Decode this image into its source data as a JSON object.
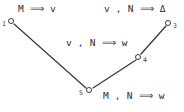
{
  "diagram": {
    "background_color": "#ffffff",
    "stroke_color": "#3a3a3a",
    "text_color": "#2b2b2b",
    "nodes": [
      {
        "id": "1",
        "label": "1",
        "x": 11,
        "y": 21
      },
      {
        "id": "3",
        "label": "3",
        "x": 168,
        "y": 23
      },
      {
        "id": "4",
        "label": "4",
        "x": 138,
        "y": 57
      },
      {
        "id": "5",
        "label": "5",
        "x": 89,
        "y": 90
      }
    ],
    "edges": [
      {
        "from": "1",
        "to": "5",
        "x1": 14,
        "y1": 24,
        "x2": 86,
        "y2": 88
      },
      {
        "from": "5",
        "to": "4",
        "x1": 93,
        "y1": 88,
        "x2": 136,
        "y2": 60
      },
      {
        "from": "4",
        "to": "3",
        "x1": 141,
        "y1": 54,
        "x2": 166,
        "y2": 26
      }
    ],
    "labels": [
      {
        "name": "judgement-node-1",
        "text": "M ⟹ v",
        "x": 18,
        "y": 3
      },
      {
        "name": "judgement-node-3",
        "text": "v , N ⟹ Δ",
        "x": 104,
        "y": 3
      },
      {
        "name": "judgement-node-4",
        "text": "v , N ⟹ w",
        "x": 66,
        "y": 37
      },
      {
        "name": "judgement-node-5",
        "text": "M , N ⟹ w",
        "x": 103,
        "y": 90
      }
    ]
  }
}
